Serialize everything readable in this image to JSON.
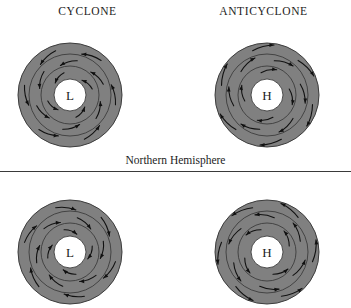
{
  "figure": {
    "width": 351,
    "height": 308,
    "background": "#ffffff"
  },
  "colors": {
    "disk_fill": "#808080",
    "disk_stroke": "#3c3c3c",
    "center_fill": "#ffffff",
    "arrow": "#111111",
    "text": "#1c1c1c",
    "divider": "#3a3a3a"
  },
  "headers": {
    "cyclone": "CYCLONE",
    "anticyclone": "ANTICYCLONE"
  },
  "hemispheres": {
    "northern_label": "Northern Hemisphere"
  },
  "systems": [
    {
      "id": "nh-low",
      "hemisphere": "Northern Hemisphere",
      "type": "CYCLONE",
      "center_letter": "L",
      "pressure": "low",
      "rotation": "counterclockwise",
      "radial_flow": "inward",
      "arrow_count": 16
    },
    {
      "id": "nh-high",
      "hemisphere": "Northern Hemisphere",
      "type": "ANTICYCLONE",
      "center_letter": "H",
      "pressure": "high",
      "rotation": "clockwise",
      "radial_flow": "outward",
      "arrow_count": 16
    },
    {
      "id": "sh-low",
      "hemisphere": "Southern Hemisphere",
      "type": "CYCLONE",
      "center_letter": "L",
      "pressure": "low",
      "rotation": "clockwise",
      "radial_flow": "inward",
      "arrow_count": 16
    },
    {
      "id": "sh-high",
      "hemisphere": "Southern Hemisphere",
      "type": "ANTICYCLONE",
      "center_letter": "H",
      "pressure": "high",
      "rotation": "counterclockwise",
      "radial_flow": "outward",
      "arrow_count": 16
    }
  ],
  "geometry": {
    "outer_radius": 52,
    "ring_radii": [
      41,
      29
    ],
    "center_radius": 16
  }
}
